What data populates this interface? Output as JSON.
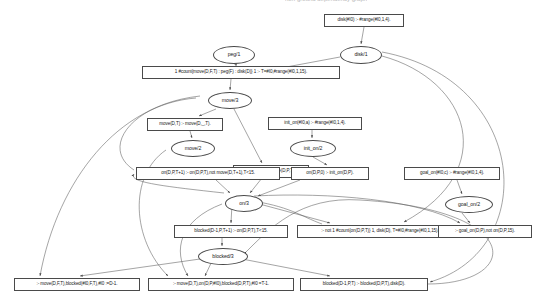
{
  "diagram": {
    "title": "non-ground dependency graph",
    "kind": "asp-rule-dependency-graph",
    "colors": {
      "node_border": "#4a4a4a",
      "node_fill": "#ffffff",
      "edge": "#5a5a5a",
      "text": "#1a1a1a",
      "background": "#ffffff"
    },
    "predicate_nodes": [
      {
        "id": "peg1",
        "label": "peg/1",
        "x": 213,
        "y": 46,
        "w": 42,
        "h": 18,
        "fs": 5.2
      },
      {
        "id": "disk1",
        "label": "disk/1",
        "x": 340,
        "y": 46,
        "w": 42,
        "h": 18,
        "fs": 5.2
      },
      {
        "id": "move3",
        "label": "move/3",
        "x": 208,
        "y": 92,
        "w": 44,
        "h": 17,
        "fs": 5.2
      },
      {
        "id": "move2",
        "label": "move/2",
        "x": 171,
        "y": 140,
        "w": 44,
        "h": 17,
        "fs": 5.2
      },
      {
        "id": "init_on2",
        "label": "init_on/2",
        "x": 290,
        "y": 140,
        "w": 46,
        "h": 17,
        "fs": 5.2
      },
      {
        "id": "goal_on2",
        "label": "goal_on/2",
        "x": 445,
        "y": 196,
        "w": 48,
        "h": 17,
        "fs": 5.2
      },
      {
        "id": "on3",
        "label": "on/3",
        "x": 225,
        "y": 195,
        "w": 38,
        "h": 17,
        "fs": 5.2
      },
      {
        "id": "blocked3",
        "label": "blocked/3",
        "x": 198,
        "y": 248,
        "w": 50,
        "h": 17,
        "fs": 5.2
      }
    ],
    "rule_nodes": [
      {
        "id": "rule_disk_range",
        "label": "disk(#I0) :- #range(#I0,1,4).",
        "x": 324,
        "y": 14,
        "w": 80,
        "h": 13,
        "fs": 4.6
      },
      {
        "id": "rule_move_choice",
        "label": "1 #count{move(D,F,T) : peg(F) : disk(D)} 1 :- T=#I0,#range(#I0,1,15).",
        "x": 142,
        "y": 66,
        "w": 198,
        "h": 13,
        "fs": 4.6
      },
      {
        "id": "rule_move2_from_move3",
        "label": "move(D,T) :- move(D,_,T).",
        "x": 147,
        "y": 118,
        "w": 76,
        "h": 13,
        "fs": 4.6
      },
      {
        "id": "rule_init_on_range",
        "label": "init_on(#I0,a) :- #range(#I0,1,4).",
        "x": 268,
        "y": 117,
        "w": 94,
        "h": 13,
        "fs": 4.6
      },
      {
        "id": "rule_on_from_move",
        "label": "on(D,P,T) :- move(D,P,T).",
        "x": 233,
        "y": 165,
        "w": 76,
        "h": 13,
        "fs": 4.6
      },
      {
        "id": "rule_on_inertia",
        "label": "on(D,P,T+1) :- on(D,P,T),not move(D,T+1),T<15.",
        "x": 136,
        "y": 167,
        "w": 144,
        "h": 13,
        "fs": 4.6
      },
      {
        "id": "rule_on_init",
        "label": "on(D,P,0) :- init_on(D,P).",
        "x": 291,
        "y": 167,
        "w": 78,
        "h": 13,
        "fs": 4.6
      },
      {
        "id": "rule_goal_on_range",
        "label": "goal_on(#I0,c) :- #range(#I0,1,4).",
        "x": 404,
        "y": 167,
        "w": 96,
        "h": 13,
        "fs": 4.6
      },
      {
        "id": "rule_blocked_on",
        "label": "blocked(D-1,P,T+1) :- on(D,P,T),T<15.",
        "x": 174,
        "y": 225,
        "w": 114,
        "h": 13,
        "fs": 4.6
      },
      {
        "id": "rule_count_constraint",
        "label": ":- not 1 #count{on(D,P,T)} 1, disk(D), T=#I0,#range(#I0,1,15).",
        "x": 297,
        "y": 225,
        "w": 166,
        "h": 13,
        "fs": 4.6
      },
      {
        "id": "rule_goal_constraint",
        "label": ":- goal_on(D,P),not on(D,P,15).",
        "x": 438,
        "y": 225,
        "w": 94,
        "h": 13,
        "fs": 4.6
      },
      {
        "id": "rule_move_blocked_from",
        "label": ":- move(D,F,T),blocked(#I0,F,T),#I0 :=D-1.",
        "x": 14,
        "y": 278,
        "w": 126,
        "h": 13,
        "fs": 4.6
      },
      {
        "id": "rule_move_blocked_disk",
        "label": ":- move(D,T),on(D,P,#I0),blocked(D,P,T),#I0 =T-1.",
        "x": 148,
        "y": 278,
        "w": 146,
        "h": 13,
        "fs": 4.6
      },
      {
        "id": "rule_blocked_cascade",
        "label": "blocked(D-1,P,T) :- blocked(D,P,T),disk(D).",
        "x": 300,
        "y": 278,
        "w": 128,
        "h": 13,
        "fs": 4.6
      }
    ],
    "edges": [
      {
        "from": "rule_disk_range",
        "to": "disk1",
        "path": "M 364 27 L 361 44",
        "arrow": true
      },
      {
        "from": "peg1",
        "to": "rule_move_choice",
        "path": "M 234 64 L 236 64 L 236 66",
        "arrow": true
      },
      {
        "from": "disk1",
        "to": "rule_move_choice",
        "path": "M 340 57 L 281 68",
        "arrow": true
      },
      {
        "from": "rule_move_choice",
        "to": "move3",
        "path": "M 231 79 L 230 90",
        "arrow": true
      },
      {
        "from": "move3",
        "to": "rule_move2_from_move3",
        "path": "M 216 109 L 199 116",
        "arrow": true
      },
      {
        "from": "move3",
        "to": "rule_on_from_move",
        "path": "M 234 109 L 262 163",
        "arrow": true
      },
      {
        "from": "rule_move2_from_move3",
        "to": "move2",
        "path": "M 190 131 L 192 138",
        "arrow": true
      },
      {
        "from": "rule_init_on_range",
        "to": "init_on2",
        "path": "M 312 130 L 312 138",
        "arrow": true
      },
      {
        "from": "init_on2",
        "to": "rule_on_init",
        "path": "M 313 157 L 327 165",
        "arrow": true
      },
      {
        "from": "rule_on_from_move",
        "to": "on3",
        "path": "M 262 178 L 250 193",
        "arrow": true
      },
      {
        "from": "rule_on_inertia",
        "to": "on3",
        "path": "M 216 180 L 230 193",
        "arrow": true
      },
      {
        "from": "rule_on_init",
        "to": "on3",
        "path": "M 300 180 L 258 196",
        "arrow": true
      },
      {
        "from": "on3",
        "to": "rule_on_inertia",
        "path": "M 224 193 C 160 186 128 182 134 174",
        "arrow": true
      },
      {
        "from": "rule_goal_on_range",
        "to": "goal_on2",
        "path": "M 457 180 L 462 194",
        "arrow": true
      },
      {
        "from": "on3",
        "to": "rule_blocked_on",
        "path": "M 232 204 L 231 223",
        "arrow": true
      },
      {
        "from": "on3",
        "to": "rule_count_constraint",
        "path": "M 252 202 L 330 223",
        "arrow": true
      },
      {
        "from": "goal_on2",
        "to": "rule_goal_constraint",
        "path": "M 462 213 L 470 223",
        "arrow": true
      },
      {
        "from": "on3",
        "to": "rule_goal_constraint",
        "path": "M 254 196 C 330 192 420 200 460 223",
        "arrow": true
      },
      {
        "from": "rule_blocked_on",
        "to": "blocked3",
        "path": "M 222 238 L 222 246",
        "arrow": true
      },
      {
        "from": "blocked3",
        "to": "rule_move_blocked_from",
        "path": "M 200 259 L 80 276",
        "arrow": true
      },
      {
        "from": "blocked3",
        "to": "rule_move_blocked_disk",
        "path": "M 212 261 L 205 276",
        "arrow": true
      },
      {
        "from": "blocked3",
        "to": "rule_blocked_cascade",
        "path": "M 242 259 L 330 276",
        "arrow": true
      },
      {
        "from": "rule_blocked_cascade",
        "to": "blocked3",
        "path": "M 428 284 C 520 284 528 210 360 200 C 300 196 270 228 244 254",
        "arrow": true
      },
      {
        "from": "move3",
        "to": "rule_move_blocked_from",
        "path": "M 196 98 C 120 104 58 178 40 276",
        "arrow": true
      },
      {
        "from": "move2",
        "to": "rule_move_blocked_disk",
        "path": "M 166 150 C 128 176 132 240 168 276",
        "arrow": true
      },
      {
        "from": "on3",
        "to": "rule_move_blocked_disk",
        "path": "M 222 204 C 180 220 172 250 188 276",
        "arrow": true
      },
      {
        "from": "disk1",
        "to": "rule_count_constraint",
        "path": "M 382 56 C 470 80 500 170 404 222",
        "arrow": true
      },
      {
        "from": "disk1",
        "to": "rule_blocked_cascade",
        "path": "M 382 52 C 530 80 540 250 430 282",
        "arrow": true
      },
      {
        "from": "move3",
        "to": "rule_on_inertia",
        "path": "M 200 96 C 130 104 100 148 134 170",
        "arrow": false
      },
      {
        "from": "on3",
        "to": "rule_count_constraint",
        "path": "M 246 200 C 290 206 300 216 322 224",
        "arrow": false
      }
    ]
  }
}
